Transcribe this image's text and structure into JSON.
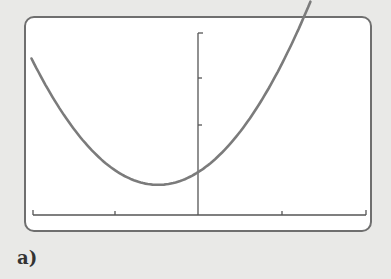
{
  "panel_label": "a)",
  "colors": {
    "background": "#e9e9e7",
    "frame_border": "#6f6f6f",
    "curve": "#7b7b7b",
    "axis": "#555555"
  },
  "chart_data": {
    "type": "line",
    "title": "",
    "xlabel": "",
    "ylabel": "",
    "grid": false,
    "legend": null,
    "xlim": [
      -2,
      2
    ],
    "x_ticks": [
      -2,
      -1,
      0,
      1,
      2
    ],
    "y_ticks": [
      0,
      1,
      2,
      3,
      4
    ],
    "ylim": [
      0,
      4
    ],
    "series": [
      {
        "name": "f(x)",
        "vertex": [
          -0.48,
          0.67
        ],
        "x": [
          -2.0,
          -1.5,
          -1.0,
          -0.48,
          0.0,
          0.5,
          1.0,
          1.5,
          1.35
        ],
        "y": [
          3.0,
          1.9,
          1.05,
          0.67,
          0.95,
          1.75,
          2.85,
          4.2,
          3.95
        ]
      }
    ],
    "y_intercept": 0.95
  }
}
